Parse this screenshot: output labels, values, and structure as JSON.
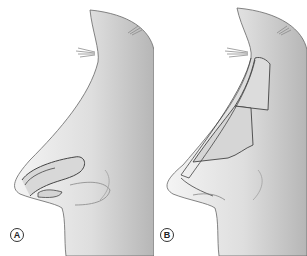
{
  "figure": {
    "panels": [
      {
        "label": "A",
        "content": "Nose profile with tip/alar graft outline"
      },
      {
        "label": "B",
        "content": "Nose profile with dorsal onlay graft segments along the nasal dorsum"
      }
    ]
  },
  "colors": {
    "skin_light": "#f2f2f2",
    "skin_shade": "#b9b9b9",
    "outline": "#555555",
    "label_border": "#333333"
  }
}
